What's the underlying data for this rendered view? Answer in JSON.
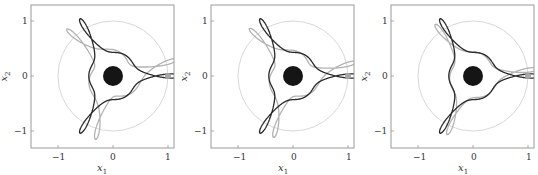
{
  "chart_data": [
    {
      "type": "line",
      "panel": 1,
      "title": "",
      "xlabel": "x1",
      "ylabel": "x2",
      "xlim": [
        -1.5,
        1.1
      ],
      "ylim": [
        -1.3,
        1.3
      ],
      "xticks": [
        -1,
        0,
        1
      ],
      "yticks": [
        -1,
        0,
        1
      ],
      "grid": false,
      "legend": null,
      "series": [
        {
          "name": "trajectory (dark)",
          "color": "#2b2b2b",
          "description": "three-lobed closed orbit with cusp-loop near (0.95, 0)"
        },
        {
          "name": "trajectory (light)",
          "color": "#b0b0b0",
          "description": "slightly rotated/offset companion orbit"
        },
        {
          "name": "reference circle",
          "color": "#d0d0d0",
          "center": [
            0,
            0
          ],
          "radius": 1.0
        },
        {
          "name": "central body",
          "color": "#111111",
          "center": [
            0,
            0
          ],
          "radius": 0.18
        },
        {
          "name": "marker",
          "color": "#a8a8a8",
          "point": [
            1.0,
            0
          ]
        }
      ]
    },
    {
      "type": "line",
      "panel": 2,
      "xlabel": "x1",
      "ylabel": "x2",
      "xlim": [
        -1.5,
        1.1
      ],
      "ylim": [
        -1.3,
        1.3
      ],
      "xticks": [
        -1,
        0,
        1
      ],
      "yticks": [
        -1,
        0,
        1
      ],
      "grid": false,
      "legend": null,
      "series": [
        {
          "name": "trajectory (dark)",
          "color": "#2b2b2b"
        },
        {
          "name": "trajectory (light)",
          "color": "#b0b0b0"
        },
        {
          "name": "reference circle",
          "color": "#d0d0d0",
          "center": [
            0,
            0
          ],
          "radius": 1.0
        },
        {
          "name": "central body",
          "color": "#111111",
          "center": [
            0,
            0
          ],
          "radius": 0.18
        },
        {
          "name": "marker",
          "color": "#a8a8a8",
          "point": [
            1.0,
            0
          ]
        }
      ]
    },
    {
      "type": "line",
      "panel": 3,
      "xlabel": "x1",
      "ylabel": "x2",
      "xlim": [
        -1.5,
        1.1
      ],
      "ylim": [
        -1.3,
        1.3
      ],
      "xticks": [
        -1,
        0,
        1
      ],
      "yticks": [
        -1,
        0,
        1
      ],
      "grid": false,
      "legend": null,
      "series": [
        {
          "name": "trajectory (dark)",
          "color": "#2b2b2b"
        },
        {
          "name": "trajectory (light)",
          "color": "#bdbdbd",
          "description": "closer to dark orbit than in panels 1-2"
        },
        {
          "name": "reference circle",
          "color": "#d0d0d0",
          "center": [
            0,
            0
          ],
          "radius": 1.0
        },
        {
          "name": "central body",
          "color": "#111111",
          "center": [
            0,
            0
          ],
          "radius": 0.18
        },
        {
          "name": "marker",
          "color": "#a8a8a8",
          "point": [
            1.0,
            0
          ]
        }
      ]
    }
  ],
  "axes": {
    "xtick_labels": [
      "−1",
      "0",
      "1"
    ],
    "ytick_labels": [
      "1",
      "0",
      "−1"
    ],
    "xlabel_var": "x",
    "xlabel_sub": "1",
    "ylabel_var": "x",
    "ylabel_sub": "2"
  },
  "colors": {
    "frame": "#9a9a9a",
    "dark_curve": "#2b2b2b",
    "light_curve": "#b3b3b3",
    "circle": "#d4d4d4",
    "body": "#151515",
    "marker": "#a8a8a8"
  }
}
